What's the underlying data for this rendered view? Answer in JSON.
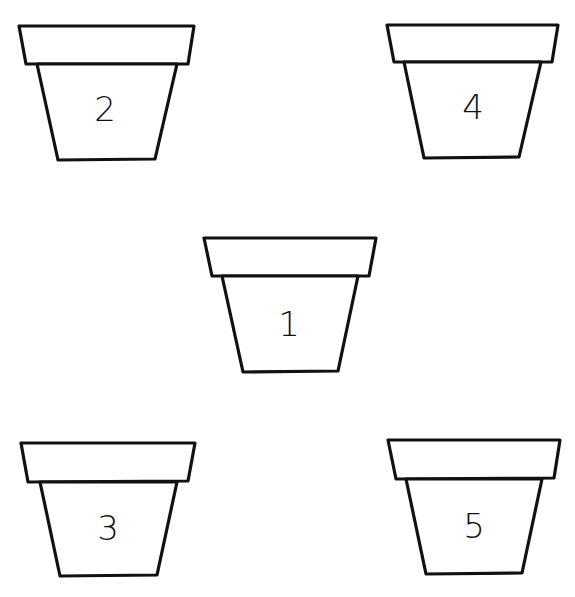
{
  "worksheet": {
    "stroke_color": "#111111",
    "background": "#ffffff",
    "pots": [
      {
        "label": "2",
        "rim": [
          [
            19,
            26
          ],
          [
            194,
            26
          ],
          [
            188,
            64
          ],
          [
            26,
            64
          ]
        ],
        "body": [
          [
            37,
            64
          ],
          [
            177,
            64
          ],
          [
            155,
            159
          ],
          [
            58,
            160
          ]
        ],
        "num_pos": [
          105,
          120
        ]
      },
      {
        "label": "4",
        "rim": [
          [
            387,
            25
          ],
          [
            558,
            25
          ],
          [
            552,
            62
          ],
          [
            394,
            62
          ]
        ],
        "body": [
          [
            404,
            62
          ],
          [
            541,
            62
          ],
          [
            519,
            157
          ],
          [
            424,
            158
          ]
        ],
        "num_pos": [
          473,
          118
        ]
      },
      {
        "label": "1",
        "rim": [
          [
            204,
            238
          ],
          [
            376,
            238
          ],
          [
            369,
            276
          ],
          [
            212,
            276
          ]
        ],
        "body": [
          [
            222,
            276
          ],
          [
            358,
            276
          ],
          [
            338,
            371
          ],
          [
            243,
            372
          ]
        ],
        "num_pos": [
          289,
          333
        ]
      },
      {
        "label": "3",
        "rim": [
          [
            21,
            443
          ],
          [
            195,
            443
          ],
          [
            188,
            481
          ],
          [
            28,
            482
          ]
        ],
        "body": [
          [
            40,
            482
          ],
          [
            177,
            482
          ],
          [
            157,
            575
          ],
          [
            60,
            576
          ]
        ],
        "num_pos": [
          108,
          537
        ]
      },
      {
        "label": "5",
        "rim": [
          [
            388,
            440
          ],
          [
            560,
            440
          ],
          [
            554,
            478
          ],
          [
            396,
            479
          ]
        ],
        "body": [
          [
            406,
            479
          ],
          [
            542,
            479
          ],
          [
            522,
            573
          ],
          [
            426,
            574
          ]
        ],
        "num_pos": [
          474,
          535
        ]
      }
    ]
  }
}
